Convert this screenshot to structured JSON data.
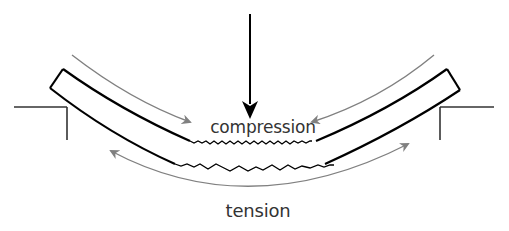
{
  "diagram": {
    "labels": {
      "compression": "compression",
      "tension": "tension"
    },
    "elements": {
      "load_arrow": {
        "direction": "down",
        "color": "#000000"
      },
      "beam": {
        "shape": "curved",
        "outline_color": "#000000"
      },
      "supports": [
        "left",
        "right"
      ],
      "compression_arrows": {
        "direction": "inward",
        "color": "#808080"
      },
      "tension_arrows": {
        "direction": "outward",
        "color": "#808080"
      },
      "wavy_fiber_lines": [
        "top-compression",
        "bottom-tension"
      ]
    },
    "colors": {
      "outline": "#000000",
      "force_arrows": "#808080",
      "text": "#333333",
      "background": "#ffffff"
    }
  }
}
